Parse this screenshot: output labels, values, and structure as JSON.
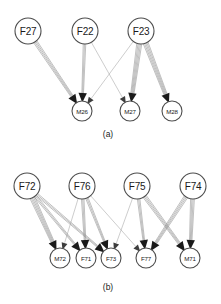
{
  "figure": {
    "panels": [
      {
        "id": "panel-a",
        "caption": "(a)",
        "caption_x": 108,
        "caption_y": 137,
        "top_nodes": [
          {
            "id": "F27",
            "label": "F27",
            "cx": 28,
            "cy": 31,
            "r": 13
          },
          {
            "id": "F22",
            "label": "F22",
            "cx": 85,
            "cy": 31,
            "r": 13
          },
          {
            "id": "F23",
            "label": "F23",
            "cx": 141,
            "cy": 31,
            "r": 13
          }
        ],
        "bottom_nodes": [
          {
            "id": "M26",
            "label": "M26",
            "cx": 82,
            "cy": 111,
            "r": 10
          },
          {
            "id": "M27",
            "label": "M27",
            "cx": 130,
            "cy": 111,
            "r": 10
          },
          {
            "id": "M28",
            "label": "M28",
            "cx": 172,
            "cy": 111,
            "r": 10
          }
        ],
        "edges": [
          {
            "from": "F27",
            "to": "M26",
            "multiplicity": 4,
            "style": "bundle"
          },
          {
            "from": "F22",
            "to": "M26",
            "multiplicity": 3,
            "style": "bundle"
          },
          {
            "from": "F22",
            "to": "M27",
            "multiplicity": 1,
            "style": "thin"
          },
          {
            "from": "F23",
            "to": "M26",
            "multiplicity": 1,
            "style": "thin"
          },
          {
            "from": "F23",
            "to": "M27",
            "multiplicity": 5,
            "style": "bundle"
          },
          {
            "from": "F23",
            "to": "M28",
            "multiplicity": 5,
            "style": "bundle"
          }
        ]
      },
      {
        "id": "panel-b",
        "caption": "(b)",
        "caption_x": 108,
        "caption_y": 290,
        "top_nodes": [
          {
            "id": "F72",
            "label": "F72",
            "cx": 27,
            "cy": 186,
            "r": 13
          },
          {
            "id": "F76",
            "label": "F76",
            "cx": 82,
            "cy": 186,
            "r": 13
          },
          {
            "id": "F75",
            "label": "F75",
            "cx": 137,
            "cy": 186,
            "r": 13
          },
          {
            "id": "F74",
            "label": "F74",
            "cx": 193,
            "cy": 186,
            "r": 13
          }
        ],
        "bottom_nodes": [
          {
            "id": "M72",
            "label": "M72",
            "cx": 60,
            "cy": 258,
            "r": 10
          },
          {
            "id": "F71",
            "label": "F71",
            "cx": 86,
            "cy": 258,
            "r": 10
          },
          {
            "id": "F73",
            "label": "F73",
            "cx": 111,
            "cy": 258,
            "r": 10
          },
          {
            "id": "F77",
            "label": "F77",
            "cx": 146,
            "cy": 258,
            "r": 10
          },
          {
            "id": "M71",
            "label": "M71",
            "cx": 190,
            "cy": 258,
            "r": 10
          }
        ],
        "edges": [
          {
            "from": "F72",
            "to": "M72",
            "multiplicity": 5,
            "style": "bundle"
          },
          {
            "from": "F72",
            "to": "F71",
            "multiplicity": 3,
            "style": "bundle"
          },
          {
            "from": "F72",
            "to": "F73",
            "multiplicity": 3,
            "style": "bundle"
          },
          {
            "from": "F76",
            "to": "M72",
            "multiplicity": 1,
            "style": "thin"
          },
          {
            "from": "F76",
            "to": "F71",
            "multiplicity": 3,
            "style": "bundle"
          },
          {
            "from": "F76",
            "to": "F73",
            "multiplicity": 3,
            "style": "bundle"
          },
          {
            "from": "F76",
            "to": "F77",
            "multiplicity": 1,
            "style": "thin"
          },
          {
            "from": "F75",
            "to": "F73",
            "multiplicity": 1,
            "style": "thin"
          },
          {
            "from": "F75",
            "to": "F77",
            "multiplicity": 3,
            "style": "bundle"
          },
          {
            "from": "F75",
            "to": "M71",
            "multiplicity": 4,
            "style": "bundle"
          },
          {
            "from": "F74",
            "to": "F77",
            "multiplicity": 4,
            "style": "bundle"
          },
          {
            "from": "F74",
            "to": "M71",
            "multiplicity": 4,
            "style": "bundle"
          }
        ]
      }
    ]
  },
  "colors": {
    "background": "#ffffff",
    "node_stroke": "#4d4d4d",
    "edge": "#8c8c8c",
    "arrow": "#1a1a1a",
    "text": "#1a1a1a"
  }
}
